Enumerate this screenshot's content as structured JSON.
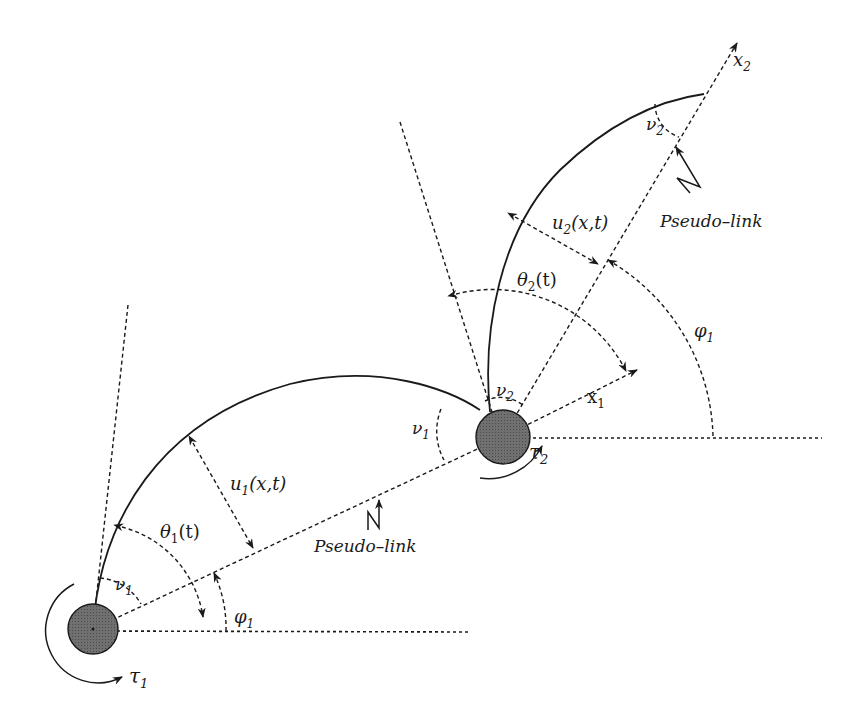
{
  "figure": {
    "joint_fill": "#6e6e6e",
    "labels": {
      "tau1": "τ",
      "tau1_sub": "1",
      "tau2": "τ",
      "tau2_sub": "2",
      "nu1_a": "ν",
      "nu1_a_sub": "1",
      "nu1_b": "ν",
      "nu1_b_sub": "1",
      "nu2_a": "ν",
      "nu2_a_sub": "2",
      "nu2_b": "ν",
      "nu2_b_sub": "2",
      "theta1": "θ",
      "theta1_sub": "1",
      "theta1_arg": "(t)",
      "theta2": "θ",
      "theta2_sub": "2",
      "theta2_arg": "(t)",
      "phi1_a": "φ",
      "phi1_a_sub": "1",
      "phi1_b": "φ",
      "phi1_b_sub": "1",
      "u1": "u",
      "u1_sub": "1",
      "u1_arg": "(x,t)",
      "u2": "u",
      "u2_sub": "2",
      "u2_arg": "(x,t)",
      "x1": "x",
      "x1_sub": "1",
      "x2": "x",
      "x2_sub": "2",
      "pseudo_link_1": "Pseudo–link",
      "pseudo_link_2": "Pseudo–link"
    }
  }
}
